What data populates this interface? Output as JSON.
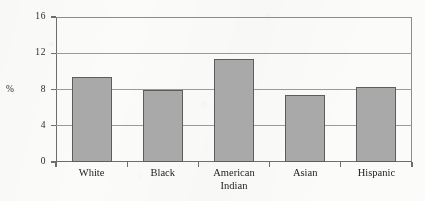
{
  "chart_data": {
    "type": "bar",
    "title": "",
    "subtitle": "",
    "xlabel": "",
    "ylabel": "%",
    "categories": [
      "White",
      "Black",
      "American Indian",
      "Asian",
      "Hispanic"
    ],
    "category_lines": [
      [
        "White"
      ],
      [
        "Black"
      ],
      [
        "American",
        "Indian"
      ],
      [
        "Asian"
      ],
      [
        "Hispanic"
      ]
    ],
    "values": [
      9.4,
      7.9,
      11.4,
      7.4,
      8.3
    ],
    "ylim": [
      0,
      16
    ],
    "yticks": [
      0,
      4,
      8,
      12,
      16
    ],
    "ytick_labels": [
      "0",
      "4",
      "8",
      "12",
      "16"
    ],
    "grid": true,
    "grid_axis": "y",
    "legend": "none",
    "bar_fill": "#a9a9a9",
    "bar_edge": "#5d5d5d",
    "axis_color": "#6e6e6e",
    "grid_color": "#9a9a9a",
    "background": "#fbfbfa"
  },
  "axis": {
    "unit_label": "%"
  },
  "caption": {
    "text": ""
  }
}
